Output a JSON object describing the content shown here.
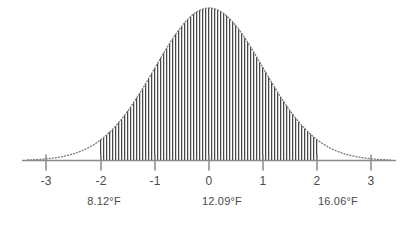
{
  "chart_data": {
    "type": "area",
    "title": "",
    "subtitle": "",
    "xlabel": "",
    "ylabel": "",
    "grid": false,
    "legend": null,
    "distribution": "normal",
    "mean": 0,
    "stddev": 1,
    "xlim": [
      -3.35,
      3.35
    ],
    "ylim": [
      0,
      1.0
    ],
    "axis_ticks": [
      {
        "value": -3,
        "label": "-3",
        "x_px": 46
      },
      {
        "value": -2,
        "label": "-2",
        "x_px": 101
      },
      {
        "value": -1,
        "label": "-1",
        "x_px": 155
      },
      {
        "value": 0,
        "label": "0",
        "x_px": 209
      },
      {
        "value": 1,
        "label": "1",
        "x_px": 263
      },
      {
        "value": 2,
        "label": "2",
        "x_px": 317
      },
      {
        "value": 3,
        "label": "3",
        "x_px": 371
      }
    ],
    "shaded_region": {
      "from": -2,
      "to": 2,
      "fill_style": "vertical-hatch",
      "hatch_spacing_px": 3
    },
    "annotations": [
      {
        "label": "8.12°F",
        "at_tick": -2,
        "x_px": 104
      },
      {
        "label": "12.09°F",
        "at_tick": 0,
        "x_px": 222
      },
      {
        "label": "16.06°F",
        "at_tick": 2,
        "x_px": 338
      }
    ],
    "curve_style": "dotted",
    "x": [
      -3.3,
      -3.0,
      -2.75,
      -2.5,
      -2.25,
      -2.0,
      -1.75,
      -1.5,
      -1.25,
      -1.0,
      -0.75,
      -0.5,
      -0.25,
      0.0,
      0.25,
      0.5,
      0.75,
      1.0,
      1.25,
      1.5,
      1.75,
      2.0,
      2.25,
      2.5,
      2.75,
      3.0,
      3.3
    ],
    "y": [
      0.004,
      0.011,
      0.023,
      0.044,
      0.079,
      0.135,
      0.216,
      0.325,
      0.458,
      0.607,
      0.755,
      0.882,
      0.969,
      1.0,
      0.969,
      0.882,
      0.755,
      0.607,
      0.458,
      0.325,
      0.216,
      0.135,
      0.079,
      0.044,
      0.023,
      0.011,
      0.004
    ]
  },
  "colors": {
    "axis": "#8a8a8a",
    "hatch": "#303030",
    "curve": "#7a7a7a",
    "text": "#4a4a4a",
    "background": "#ffffff"
  }
}
